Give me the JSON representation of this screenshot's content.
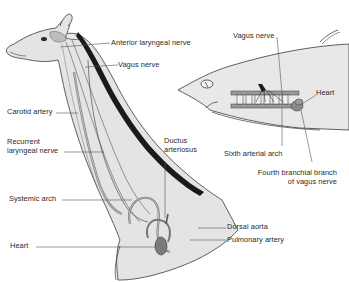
{
  "diagram": {
    "type": "anatomical-comparison",
    "subjects": [
      "giraffe",
      "shark"
    ],
    "colors": {
      "outline": "#3a3a3a",
      "skin": "#e4e4e4",
      "mane": "#1a1a1a",
      "vessel": "#8a8a8a",
      "heart": "#7a7a7a",
      "label_text": "#2a2a2a",
      "leader_line": "#555555"
    },
    "giraffe": {
      "labels": {
        "anterior_laryngeal_nerve": "Anterior laryngeal nerve",
        "vagus_nerve": "Vagus nerve",
        "carotid_artery": "Carotid artery",
        "recurrent_laryngeal_nerve_1": "Recurrent",
        "recurrent_laryngeal_nerve_2": "laryngeal nerve",
        "ductus_arteriosus_1": "Ductus",
        "ductus_arteriosus_2": "arteriosus",
        "systemic_arch": "Systemic arch",
        "heart": "Heart",
        "dorsal_aorta": "Dorsal aorta",
        "pulmonary_artery": "Pulmonary artery"
      }
    },
    "shark": {
      "labels": {
        "vagus_nerve": "Vagus nerve",
        "heart": "Heart",
        "sixth_arterial_arch": "Sixth arterial arch",
        "fourth_branchial_branch_1": "Fourth branchial branch",
        "fourth_branchial_branch_2": "of vagus nerve"
      }
    }
  }
}
